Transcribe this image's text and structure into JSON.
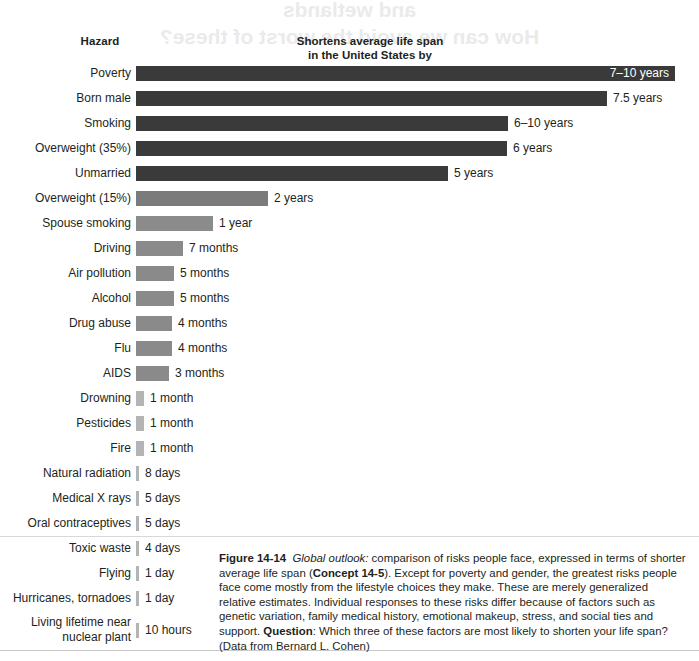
{
  "page": {
    "bleed_text_line1": "and wetlands",
    "bleed_text_line2": "How can we avoid the worst of these?"
  },
  "header": {
    "hazard_label": "Hazard",
    "metric_label_line1": "Shortens average life span",
    "metric_label_line2": "in the United States by"
  },
  "colors": {
    "bar_darkest": "#3a3a3a",
    "bar_dark": "#414141",
    "bar_medium": "#7b7b7b",
    "bar_light": "#8e8e8e",
    "bar_tick": "#b4b4b4",
    "text": "#231f20",
    "inside_value_text": "#ffffff",
    "rule": "#d8d8d8",
    "background": "#ffffff"
  },
  "chart_data": {
    "type": "bar",
    "title": "Shortens average life span in the United States by",
    "xlabel": "",
    "ylabel": "Hazard",
    "orientation": "horizontal",
    "grid": false,
    "legend": "none",
    "categories": [
      "Poverty",
      "Born male",
      "Smoking",
      "Overweight (35%)",
      "Unmarried",
      "Overweight (15%)",
      "Spouse smoking",
      "Driving",
      "Air pollution",
      "Alcohol",
      "Drug abuse",
      "Flu",
      "AIDS",
      "Drowning",
      "Pesticides",
      "Fire",
      "Natural radiation",
      "Medical X rays",
      "Oral contraceptives",
      "Toxic waste",
      "Flying",
      "Hurricanes, tornadoes",
      "Living lifetime near\nnuclear plant"
    ],
    "value_labels": [
      "7–10 years",
      "7.5 years",
      "6–10 years",
      "6 years",
      "5 years",
      "2 years",
      "1 year",
      "7 months",
      "5 months",
      "5 months",
      "4 months",
      "4 months",
      "3 months",
      "1 month",
      "1 month",
      "1 month",
      "8 days",
      "5 days",
      "5 days",
      "4 days",
      "1 day",
      "1 day",
      "10 hours"
    ],
    "values_days": [
      3103,
      2738,
      2921,
      2190,
      1826,
      730,
      365,
      213,
      152,
      152,
      122,
      122,
      91,
      30,
      30,
      30,
      8,
      5,
      5,
      4,
      1,
      1,
      0.42
    ],
    "bar_pixel_widths": [
      539,
      471,
      372,
      371,
      312,
      132,
      77,
      47,
      38,
      38,
      36,
      36,
      33,
      8,
      8,
      8,
      3,
      3,
      3,
      3,
      3,
      3,
      3
    ],
    "bar_colors": [
      "#3a3a3a",
      "#3a3a3a",
      "#3a3a3a",
      "#3a3a3a",
      "#3a3a3a",
      "#7b7b7b",
      "#8b8b8b",
      "#8a8a8a",
      "#8a8a8a",
      "#8a8a8a",
      "#8a8a8a",
      "#8a8a8a",
      "#8a8a8a",
      "#b4b4b4",
      "#b4b4b4",
      "#b4b4b4",
      "#b4b4b4",
      "#b4b4b4",
      "#b4b4b4",
      "#b4b4b4",
      "#b4b4b4",
      "#b4b4b4",
      "#b4b4b4"
    ],
    "value_inside_bar": [
      true,
      false,
      false,
      false,
      false,
      false,
      false,
      false,
      false,
      false,
      false,
      false,
      false,
      false,
      false,
      false,
      false,
      false,
      false,
      false,
      false,
      false,
      false
    ]
  },
  "caption": {
    "figure_number": "Figure 14-14",
    "lead_italic": "Global outlook:",
    "body_1": " comparison of risks people face, expressed in terms of shorter average life span (",
    "concept_bold": "Concept 14-5",
    "body_2": "). Except for poverty and gender, the greatest risks people face come mostly from the lifestyle choices they make. These are merely generalized relative estimates. Individual responses to these risks differ because of factors such as genetic variation, family medical history, emotional makeup, stress, and social ties and support. ",
    "question_bold": "Question",
    "body_3": ": Which three of these factors are most likely to shorten your life span? (Data from Bernard L. Cohen)"
  }
}
